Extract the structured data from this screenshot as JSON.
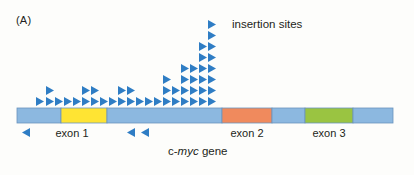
{
  "figure": {
    "panel_letter": "(A)",
    "insertion_label": "insertion sites",
    "gene_label_prefix": "c-",
    "gene_label_italic": "myc",
    "gene_label_suffix": " gene",
    "exon1_label": "exon 1",
    "exon2_label": "exon 2",
    "exon3_label": "exon 3",
    "colors": {
      "triangle_blue": "#2f7dc4",
      "gene_bar_blue": "#8cb8e0",
      "exon1_yellow": "#ffe433",
      "exon2_orange": "#f08a5d",
      "exon3_green": "#9ac441",
      "bar_outline": "#6a93bd",
      "text": "#231f20",
      "background": "#fdfdfb"
    },
    "gene_bar": {
      "x": 17,
      "y": 108,
      "width": 376,
      "height": 15,
      "segments": [
        {
          "name": "intron-left",
          "x": 17,
          "width": 44,
          "color": "#8cb8e0"
        },
        {
          "name": "exon-1",
          "x": 61,
          "width": 46,
          "color": "#ffe433"
        },
        {
          "name": "intron-mid-1",
          "x": 107,
          "width": 115,
          "color": "#8cb8e0"
        },
        {
          "name": "exon-2",
          "x": 222,
          "width": 50,
          "color": "#f08a5d"
        },
        {
          "name": "intron-mid-2",
          "x": 272,
          "width": 33,
          "color": "#8cb8e0"
        },
        {
          "name": "exon-3",
          "x": 305,
          "width": 48,
          "color": "#9ac441"
        },
        {
          "name": "intron-right",
          "x": 353,
          "width": 40,
          "color": "#8cb8e0"
        }
      ]
    },
    "insertion_columns_above": [
      {
        "x": 36,
        "count": 1
      },
      {
        "x": 46,
        "count": 2
      },
      {
        "x": 55,
        "count": 1
      },
      {
        "x": 64,
        "count": 1
      },
      {
        "x": 73,
        "count": 1
      },
      {
        "x": 82,
        "count": 2
      },
      {
        "x": 91,
        "count": 2
      },
      {
        "x": 100,
        "count": 1
      },
      {
        "x": 109,
        "count": 1
      },
      {
        "x": 118,
        "count": 2
      },
      {
        "x": 127,
        "count": 2
      },
      {
        "x": 136,
        "count": 1
      },
      {
        "x": 145,
        "count": 1
      },
      {
        "x": 154,
        "count": 1
      },
      {
        "x": 163,
        "count": 3
      },
      {
        "x": 172,
        "count": 2
      },
      {
        "x": 181,
        "count": 4
      },
      {
        "x": 190,
        "count": 4
      },
      {
        "x": 199,
        "count": 6
      },
      {
        "x": 208,
        "count": 8
      }
    ],
    "insertion_arrows_below": [
      {
        "x": 22,
        "y": 128,
        "direction": "left"
      },
      {
        "x": 127,
        "y": 128,
        "direction": "left"
      },
      {
        "x": 141,
        "y": 128,
        "direction": "left"
      }
    ]
  }
}
